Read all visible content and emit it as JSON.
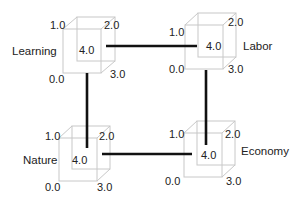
{
  "diagram": {
    "nodes": [
      {
        "id": "learning",
        "name": "Learning",
        "corners": {
          "top_left": "1.0",
          "top_right": "2.0",
          "bottom_right": "3.0",
          "bottom_left": "0.0",
          "center": "4.0"
        }
      },
      {
        "id": "labor",
        "name": "Labor",
        "corners": {
          "top_left": "1.0",
          "top_right": "2.0",
          "bottom_right": "3.0",
          "bottom_left": "0.0",
          "center": "4.0"
        }
      },
      {
        "id": "nature",
        "name": "Nature",
        "corners": {
          "top_left": "1.0",
          "top_right": "2.0",
          "bottom_right": "3.0",
          "bottom_left": "0.0",
          "center": "4.0"
        }
      },
      {
        "id": "economy",
        "name": "Economy",
        "corners": {
          "top_left": "1.0",
          "top_right": "2.0",
          "bottom_right": "3.0",
          "bottom_left": "0.0",
          "center": "4.0"
        }
      }
    ],
    "connections": [
      {
        "from": "learning",
        "to": "labor"
      },
      {
        "from": "learning",
        "to": "nature"
      },
      {
        "from": "labor",
        "to": "economy"
      },
      {
        "from": "nature",
        "to": "economy"
      }
    ],
    "colors": {
      "cube_edge": "#c8c8c8",
      "connector": "#111111",
      "text": "#222222"
    }
  }
}
